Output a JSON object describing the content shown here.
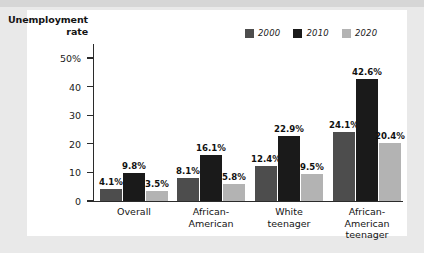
{
  "axis_title": "Unemployment\nrate",
  "legend": {
    "items": [
      {
        "label": "2000",
        "color": "#4d4d4d"
      },
      {
        "label": "2010",
        "color": "#1a1a1a"
      },
      {
        "label": "2020",
        "color": "#b3b3b3"
      }
    ]
  },
  "y_axis": {
    "ticks": [
      "50%",
      "40",
      "30",
      "20",
      "10",
      "0"
    ],
    "tick_values": [
      50,
      40,
      30,
      20,
      10,
      0
    ]
  },
  "categories": [
    "Overall",
    "African-\nAmerican",
    "White\nteenager",
    "African-\nAmerican\nteenager"
  ],
  "value_labels": [
    [
      "4.1%",
      "9.8%",
      "3.5%"
    ],
    [
      "8.1%",
      "16.1%",
      "5.8%"
    ],
    [
      "12.4%",
      "22.9%",
      "9.5%"
    ],
    [
      "24.1%",
      "42.6%",
      "20.4%"
    ]
  ],
  "chart_data": {
    "type": "bar",
    "title": "",
    "xlabel": "",
    "ylabel": "Unemployment rate",
    "ylim": [
      0,
      50
    ],
    "yticks": [
      0,
      10,
      20,
      30,
      40,
      50
    ],
    "ytick_labels": [
      "0",
      "10",
      "20",
      "30",
      "40",
      "50%"
    ],
    "grid": false,
    "legend_position": "top-right",
    "categories": [
      "Overall",
      "African-American",
      "White teenager",
      "African-American teenager"
    ],
    "series": [
      {
        "name": "2000",
        "color": "#4d4d4d",
        "values": [
          4.1,
          8.1,
          12.4,
          24.1
        ]
      },
      {
        "name": "2010",
        "color": "#1a1a1a",
        "values": [
          9.8,
          16.1,
          22.9,
          42.6
        ]
      },
      {
        "name": "2020",
        "color": "#b3b3b3",
        "values": [
          3.5,
          5.8,
          9.5,
          20.4
        ]
      }
    ]
  },
  "colors": {
    "page_background": "#e9e9e9",
    "panel_background": "#ffffff",
    "axis": "#2b2b2b",
    "text": "#141414"
  }
}
